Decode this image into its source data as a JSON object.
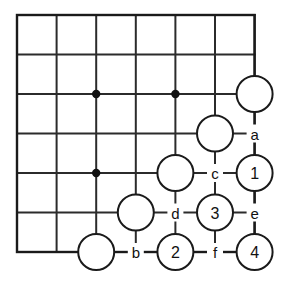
{
  "figure": {
    "kind": "go-board-diagram",
    "board_columns": 7,
    "board_rows": 7,
    "colors": {
      "line": "#2b2b2b",
      "edge": "#1a1a1a",
      "stone_fill": "#ffffff",
      "stone_stroke": "#1a1a1a",
      "star_point": "#101010",
      "text": "#111111",
      "background": "#ffffff"
    },
    "geometry": {
      "origin_x": 17,
      "origin_y": 15,
      "step_x": 39.6,
      "step_y": 39.5,
      "stone_radius": 18
    }
  },
  "grid": {
    "columns": [
      17,
      56.6,
      96.2,
      135.8,
      175.4,
      215.0,
      254.6
    ],
    "rows": [
      15,
      54.5,
      94.0,
      133.5,
      173.0,
      212.5,
      252.0
    ],
    "star_points": [
      {
        "name": "star-point-left",
        "col": 2,
        "row": 2
      },
      {
        "name": "star-point-right",
        "col": 4,
        "row": 2
      },
      {
        "name": "star-point-lower-left",
        "col": 2,
        "row": 4
      }
    ]
  },
  "stones": [
    {
      "name": "stone-unmarked-top-right",
      "col": 6,
      "row": 2,
      "label": ""
    },
    {
      "name": "stone-unmarked-upper",
      "col": 5,
      "row": 3,
      "label": ""
    },
    {
      "name": "stone-unmarked-middle",
      "col": 4,
      "row": 4,
      "label": ""
    },
    {
      "name": "stone-unmarked-lower",
      "col": 3,
      "row": 5,
      "label": ""
    },
    {
      "name": "stone-unmarked-bottom-left",
      "col": 2,
      "row": 6,
      "label": ""
    },
    {
      "name": "stone-move-1",
      "col": 6,
      "row": 4,
      "label": "1"
    },
    {
      "name": "stone-move-2",
      "col": 4,
      "row": 6,
      "label": "2"
    },
    {
      "name": "stone-move-3",
      "col": 5,
      "row": 5,
      "label": "3"
    },
    {
      "name": "stone-move-4",
      "col": 6,
      "row": 6,
      "label": "4"
    }
  ],
  "point_labels": [
    {
      "name": "point-label-a",
      "col": 6,
      "row": 3,
      "label": "a"
    },
    {
      "name": "point-label-b",
      "col": 3,
      "row": 6,
      "label": "b"
    },
    {
      "name": "point-label-c",
      "col": 5,
      "row": 4,
      "label": "c"
    },
    {
      "name": "point-label-d",
      "col": 4,
      "row": 5,
      "label": "d"
    },
    {
      "name": "point-label-e",
      "col": 6,
      "row": 5,
      "label": "e"
    },
    {
      "name": "point-label-f",
      "col": 5,
      "row": 6,
      "label": "f"
    }
  ]
}
